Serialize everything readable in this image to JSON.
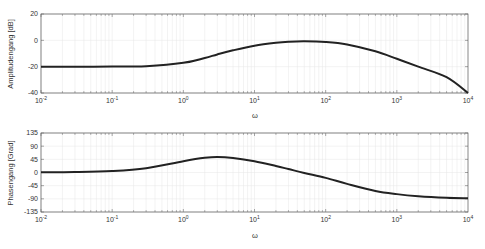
{
  "chart_data": [
    {
      "type": "line",
      "title": "",
      "xlabel": "ω",
      "ylabel": "Amplitudengang [dB]",
      "xscale": "log",
      "xlim": [
        0.01,
        10000
      ],
      "ylim": [
        -40,
        20
      ],
      "xticks": [
        "10^-2",
        "10^-1",
        "10^0",
        "10^1",
        "10^2",
        "10^3",
        "10^4"
      ],
      "yticks": [
        20,
        0,
        -20,
        -40
      ],
      "grid": true,
      "series": [
        {
          "name": "magnitude",
          "color": "#222222",
          "x": [
            0.01,
            0.03,
            0.1,
            0.3,
            1,
            2,
            3,
            5,
            10,
            20,
            30,
            50,
            100,
            200,
            500,
            1000,
            2000,
            5000,
            10000
          ],
          "values": [
            -20,
            -20,
            -19.96,
            -19.6,
            -17.1,
            -13.4,
            -10.7,
            -7.6,
            -4.1,
            -1.9,
            -1.1,
            -0.7,
            -1.2,
            -3.1,
            -8.3,
            -14.0,
            -20.0,
            -28.0,
            -40.0
          ]
        }
      ]
    },
    {
      "type": "line",
      "title": "",
      "xlabel": "ω",
      "ylabel": "Phasengang [Grad]",
      "xscale": "log",
      "xlim": [
        0.01,
        10000
      ],
      "ylim": [
        -135,
        135
      ],
      "xticks": [
        "10^-2",
        "10^-1",
        "10^0",
        "10^1",
        "10^2",
        "10^3",
        "10^4"
      ],
      "yticks": [
        135,
        90,
        45,
        0,
        -45,
        -90,
        -135
      ],
      "grid": true,
      "series": [
        {
          "name": "phase",
          "color": "#222222",
          "x": [
            0.01,
            0.03,
            0.1,
            0.3,
            1,
            2,
            3,
            5,
            10,
            20,
            30,
            50,
            100,
            200,
            500,
            1000,
            2000,
            5000,
            10000
          ],
          "values": [
            0.5,
            1.5,
            5.1,
            14.7,
            38.6,
            50.1,
            53.1,
            49.8,
            38.8,
            22.4,
            11.8,
            -1.7,
            -18.4,
            -38.9,
            -63.2,
            -73.9,
            -80.9,
            -86.3,
            -88.2
          ]
        }
      ]
    }
  ],
  "labels": {
    "top_ylabel": "Amplitudengang [dB]",
    "bottom_ylabel": "Phasengang [Grad]",
    "xlabel": "ω"
  },
  "colors": {
    "curve": "#222222",
    "axes": "#555555",
    "grid": "#e6e6e6",
    "background": "#ffffff"
  }
}
